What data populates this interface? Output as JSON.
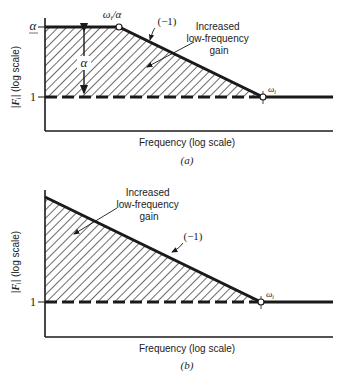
{
  "panels": [
    {
      "id": "a",
      "caption": "(a)",
      "ylabel": "|Fᵢ| (log scale)",
      "ylabel_parts": {
        "prefix": "|",
        "var": "F",
        "sub": "i",
        "suffix": "| (log scale)"
      },
      "xlabel": "Frequency (log scale)",
      "ytick_alpha": "α",
      "ytick_one": "1",
      "breakpoint_label": "ωᵢ/α",
      "breakpoint_parts": {
        "var": "ω",
        "sub": "i",
        "suffix": "/α"
      },
      "corner_label": "ωᵢ",
      "corner_parts": {
        "var": "ω",
        "sub": "i"
      },
      "slope_label": "(−1)",
      "gap_label": "α",
      "annotation": [
        "Increased",
        "low-frequency",
        "gain"
      ]
    },
    {
      "id": "b",
      "caption": "(b)",
      "ylabel": "|Fᵢ| (log scale)",
      "ylabel_parts": {
        "prefix": "|",
        "var": "F",
        "sub": "i",
        "suffix": "| (log scale)"
      },
      "xlabel": "Frequency (log scale)",
      "ytick_one": "1",
      "corner_label": "ωᵢ",
      "corner_parts": {
        "var": "ω",
        "sub": "i"
      },
      "slope_label": "(−1)",
      "annotation": [
        "Increased",
        "low-frequency",
        "gain"
      ]
    }
  ],
  "colors": {
    "ink": "#1a1a1a",
    "background": "#ffffff"
  }
}
